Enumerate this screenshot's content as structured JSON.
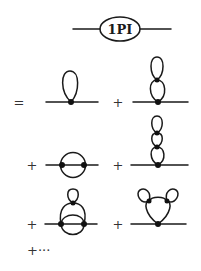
{
  "figure": {
    "header": {
      "blob_label": "1PI"
    },
    "operators": {
      "equals": "=",
      "plus": "+",
      "trailing": "+···"
    },
    "terms": [
      {
        "name": "tadpole",
        "description": "single loop at one vertex"
      },
      {
        "name": "double-tadpole",
        "description": "two stacked loops"
      },
      {
        "name": "sunset",
        "description": "two vertices with three propagators"
      },
      {
        "name": "triple-tadpole",
        "description": "three stacked loops"
      },
      {
        "name": "sunset-with-tadpole",
        "description": "sunset with loop attached on top"
      },
      {
        "name": "loop-with-two-tadpoles",
        "description": "loop with two ear loops"
      }
    ]
  }
}
